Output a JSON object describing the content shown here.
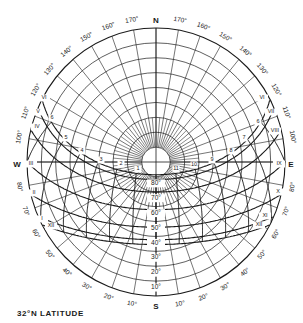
{
  "title": "32°N LATITUDE",
  "colors": {
    "ink": "#1a1a1a",
    "background": "#ffffff"
  },
  "geometry": {
    "cx": 156,
    "cy": 162,
    "rx": 129,
    "ry": 134
  },
  "cardinals": [
    {
      "label": "N",
      "x": 156,
      "y": 21
    },
    {
      "label": "S",
      "x": 156,
      "y": 307
    },
    {
      "label": "W",
      "x": 17,
      "y": 165
    },
    {
      "label": "E",
      "x": 291,
      "y": 165
    }
  ],
  "azimuth_labels": [
    "170°",
    "160°",
    "150°",
    "140°",
    "130°",
    "120°",
    "110°",
    "100°",
    "90°",
    "80°",
    "70°",
    "60°",
    "50°",
    "40°",
    "30°",
    "20°",
    "10°"
  ],
  "altitude_labels": [
    "80°",
    "70°",
    "60°",
    "50°",
    "40°",
    "30°",
    "20°",
    "10°"
  ],
  "month_labels": [
    {
      "label": "VI",
      "x": 44,
      "y": 98
    },
    {
      "label": "V",
      "x": 38,
      "y": 112
    },
    {
      "label": "IV",
      "x": 37,
      "y": 127
    },
    {
      "label": "III",
      "x": 31,
      "y": 164
    },
    {
      "label": "II",
      "x": 34,
      "y": 193
    },
    {
      "label": "I",
      "x": 42,
      "y": 219
    },
    {
      "label": "XII",
      "x": 51,
      "y": 226
    },
    {
      "label": "VI",
      "x": 262,
      "y": 98
    },
    {
      "label": "VII",
      "x": 271,
      "y": 112
    },
    {
      "label": "VIII",
      "x": 275,
      "y": 131
    },
    {
      "label": "IX",
      "x": 279,
      "y": 164
    },
    {
      "label": "X",
      "x": 278,
      "y": 192
    },
    {
      "label": "XI",
      "x": 265,
      "y": 216
    },
    {
      "label": "XII",
      "x": 259,
      "y": 225
    }
  ],
  "hour_labels": [
    {
      "label": "6",
      "x": 52,
      "y": 118
    },
    {
      "label": "5",
      "x": 66,
      "y": 138
    },
    {
      "label": "4",
      "x": 82,
      "y": 151
    },
    {
      "label": "3",
      "x": 101,
      "y": 160
    },
    {
      "label": "2",
      "x": 121,
      "y": 164
    },
    {
      "label": "1",
      "x": 138,
      "y": 169
    },
    {
      "label": "11",
      "x": 176,
      "y": 169
    },
    {
      "label": "10",
      "x": 194,
      "y": 165
    },
    {
      "label": "9",
      "x": 212,
      "y": 160
    },
    {
      "label": "8",
      "x": 231,
      "y": 151
    },
    {
      "label": "7",
      "x": 244,
      "y": 138
    },
    {
      "label": "6",
      "x": 258,
      "y": 122
    }
  ],
  "chart_data": {
    "type": "sun-path-diagram",
    "title": "32°N LATITUDE",
    "projection": "polar equidistant, zenith at center, horizon at rim",
    "latitude_deg": 32,
    "altitude_rings_deg": [
      80,
      70,
      60,
      50,
      40,
      30,
      20,
      10,
      0
    ],
    "azimuth_spokes_step_deg": 10,
    "declinations_deg": [
      23.45,
      20.2,
      11.8,
      0,
      -11.8,
      -20.2,
      -23.45
    ],
    "month_paths": [
      {
        "months": [
          "VI"
        ],
        "declination": 23.45
      },
      {
        "months": [
          "V",
          "VII"
        ],
        "declination": 20.2
      },
      {
        "months": [
          "IV",
          "VIII"
        ],
        "declination": 11.8
      },
      {
        "months": [
          "III",
          "IX"
        ],
        "declination": 0
      },
      {
        "months": [
          "II",
          "X"
        ],
        "declination": -11.8
      },
      {
        "months": [
          "I",
          "XI"
        ],
        "declination": -20.2
      },
      {
        "months": [
          "XII"
        ],
        "declination": -23.45
      }
    ],
    "hours": [
      6,
      7,
      8,
      9,
      10,
      11,
      12,
      1,
      2,
      3,
      4,
      5,
      6
    ],
    "orientation": {
      "top": "N",
      "bottom": "S",
      "left": "W",
      "right": "E"
    }
  }
}
